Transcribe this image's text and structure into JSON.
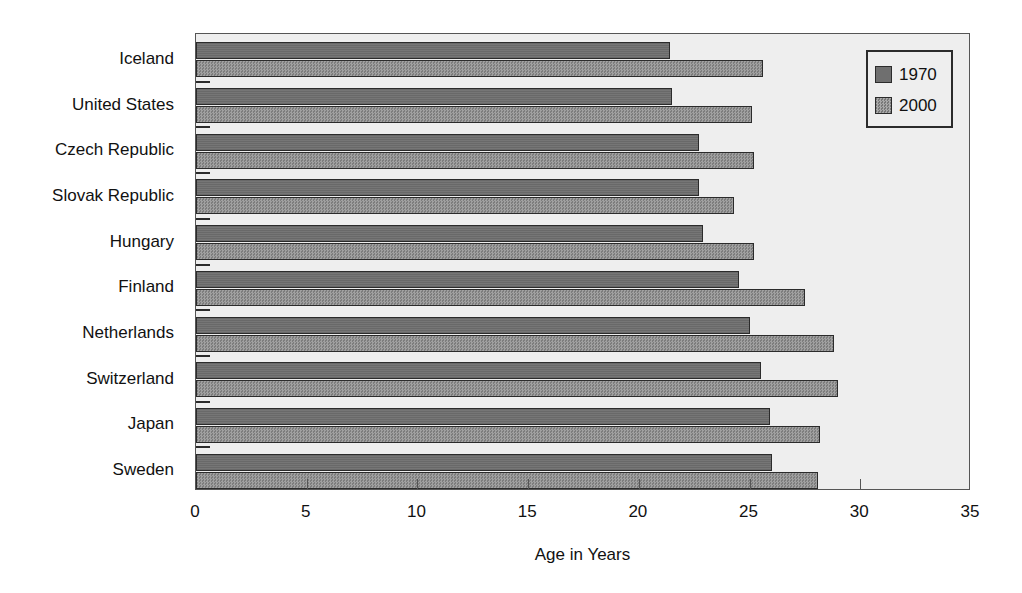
{
  "chart_data": {
    "type": "bar",
    "orientation": "horizontal",
    "title": "",
    "xlabel": "Age in Years",
    "ylabel": "",
    "xlim": [
      0,
      35
    ],
    "xticks": [
      0,
      5,
      10,
      15,
      20,
      25,
      30,
      35
    ],
    "xticklabels": [
      "0",
      "5",
      "10",
      "15",
      "20",
      "25",
      "30",
      "35"
    ],
    "grid": false,
    "legend_position": "top-right",
    "categories": [
      "Iceland",
      "United States",
      "Czech Republic",
      "Slovak Republic",
      "Hungary",
      "Finland",
      "Netherlands",
      "Switzerland",
      "Japan",
      "Sweden"
    ],
    "series": [
      {
        "name": "1970",
        "color": "#6f6f6f",
        "values": [
          21.4,
          21.5,
          22.7,
          22.7,
          22.9,
          24.5,
          25.0,
          25.5,
          25.9,
          26.0
        ]
      },
      {
        "name": "2000",
        "color": "#8d8d8d",
        "values": [
          25.6,
          25.1,
          25.2,
          24.3,
          25.2,
          27.5,
          28.8,
          29.0,
          28.2,
          28.1
        ]
      }
    ]
  },
  "legend": {
    "entries": [
      {
        "label": "1970",
        "swatch": "series-1970-swatch"
      },
      {
        "label": "2000",
        "swatch": "series-2000-swatch"
      }
    ]
  },
  "axis": {
    "x_title": "Age in Years"
  },
  "colors": {
    "plot_background": "#eeeeee",
    "page_background": "#ffffff",
    "axis_line": "#555555",
    "bar_outline": "#2b2b2b",
    "series_1970": "#6f6f6f",
    "series_2000": "#8d8d8d",
    "text": "#111111"
  }
}
